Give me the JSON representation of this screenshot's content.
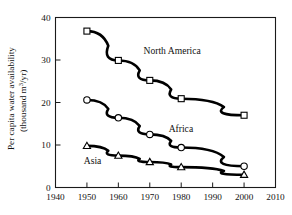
{
  "chart_data": {
    "type": "line",
    "title": "",
    "xlabel": "",
    "ylabel": "Per capita water availability (thousand m³/yr)",
    "ylabel_line1": "Per capita water availability",
    "ylabel_line2": "(thousand m",
    "ylabel_exponent": "3",
    "ylabel_line2_tail": "/yr)",
    "x": [
      1950,
      1960,
      1970,
      1980,
      2000
    ],
    "xlim": [
      1940,
      2010
    ],
    "ylim": [
      0,
      40
    ],
    "xticks": [
      "1940",
      "1950",
      "1960",
      "1970",
      "1980",
      "1990",
      "2000",
      "2010"
    ],
    "xtick_values": [
      1940,
      1950,
      1960,
      1970,
      1980,
      1990,
      2000,
      2010
    ],
    "yticks": [
      "0",
      "10",
      "20",
      "30",
      "40"
    ],
    "ytick_values": [
      0,
      10,
      20,
      30,
      40
    ],
    "grid": false,
    "legend": "inline-annotations",
    "series": [
      {
        "name": "North America",
        "marker": "open-square",
        "values": [
          36.8,
          29.9,
          25.2,
          20.9,
          17.0
        ],
        "label": "North America",
        "label_x": 1968,
        "label_y": 31.5
      },
      {
        "name": "Africa",
        "marker": "open-circle",
        "values": [
          20.6,
          16.4,
          12.5,
          9.4,
          5.0
        ],
        "label": "Africa",
        "label_x": 1976,
        "label_y": 13.0
      },
      {
        "name": "Asia",
        "marker": "open-triangle",
        "values": [
          9.8,
          7.5,
          6.0,
          4.8,
          3.0
        ],
        "label": "Asia",
        "label_x": 1949,
        "label_y": 5.6
      }
    ]
  },
  "figure": {
    "background_color": "#ffffff",
    "line_color": "#000000",
    "marker_fill": "#ffffff",
    "axis_color": "#1a1a1a"
  },
  "footer": {
    "sliver_text": ""
  }
}
